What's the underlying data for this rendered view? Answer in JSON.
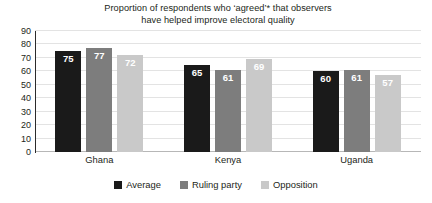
{
  "chart_data": {
    "type": "bar",
    "title_lines": [
      "Proportion of respondents who ‘agreed’* that observers",
      "have helped improve electoral quality"
    ],
    "categories": [
      "Ghana",
      "Kenya",
      "Uganda"
    ],
    "series": [
      {
        "name": "Average",
        "values": [
          75,
          65,
          60
        ],
        "color": "#1a1a1a"
      },
      {
        "name": "Ruling party",
        "values": [
          77,
          61,
          61
        ],
        "color": "#7d7d7d"
      },
      {
        "name": "Opposition",
        "values": [
          72,
          69,
          57
        ],
        "color": "#c9c9c9"
      }
    ],
    "xlabel": "",
    "ylabel": "",
    "ylim": [
      0,
      90
    ],
    "yticks": [
      90,
      80,
      70,
      60,
      50,
      40,
      30,
      20,
      10,
      0
    ],
    "grid": true,
    "legend_position": "bottom",
    "value_labels": true,
    "value_label_color": "#ffffff"
  },
  "colors": {
    "background": "#ffffff",
    "text": "#231f20",
    "gridline": "#e3e3e3",
    "axis": "#2b2b2b"
  }
}
